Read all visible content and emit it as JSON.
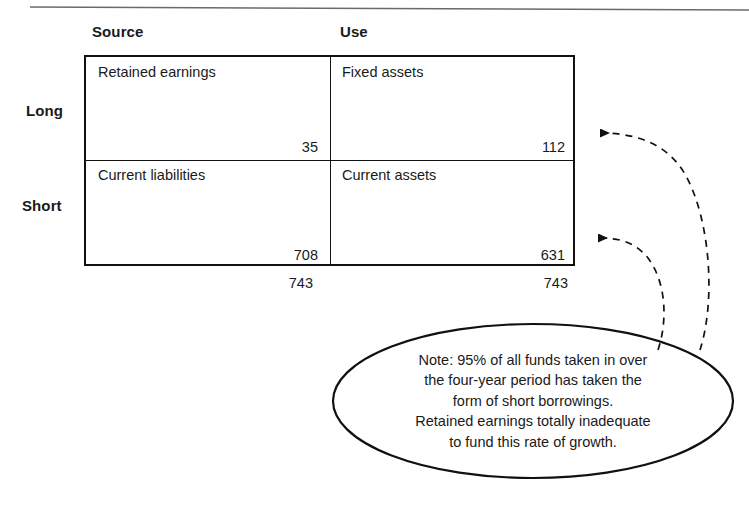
{
  "figure": {
    "top_rule": "horizontal-rule"
  },
  "matrix": {
    "column_headers": [
      {
        "key": "source",
        "label": "Source"
      },
      {
        "key": "use",
        "label": "Use"
      }
    ],
    "row_headers": [
      {
        "key": "long",
        "label": "Long"
      },
      {
        "key": "short",
        "label": "Short"
      }
    ],
    "cells": [
      {
        "row": "long",
        "column": "source",
        "label": "Retained earnings",
        "value": "35"
      },
      {
        "row": "long",
        "column": "use",
        "label": "Fixed assets",
        "value": "112"
      },
      {
        "row": "short",
        "column": "source",
        "label": "Current liabilities",
        "value": "708"
      },
      {
        "row": "short",
        "column": "use",
        "label": "Current assets",
        "value": "631"
      }
    ],
    "totals": [
      {
        "column": "source",
        "value": "743"
      },
      {
        "column": "use",
        "value": "743"
      }
    ]
  },
  "callout": {
    "shape": "ellipse",
    "lines": [
      "Note: 95% of all funds taken in over",
      "the four-year period has taken the",
      "form of short borrowings.",
      "Retained earnings totally inadequate",
      "to fund this rate of growth."
    ],
    "text": "Note: 95% of all funds taken in over the four-year period has taken the form of short borrowings. Retained earnings totally inadequate to fund this rate of growth."
  },
  "connectors": [
    {
      "name": "callout-to-fixed-assets",
      "style": "dashed-curved-arrow",
      "target": "112"
    },
    {
      "name": "callout-to-current-assets",
      "style": "dashed-curved-arrow",
      "target": "631"
    }
  ],
  "colors": {
    "ink": "#1a1a1a",
    "border": "#111111",
    "background": "#ffffff",
    "rule": "#555555"
  }
}
